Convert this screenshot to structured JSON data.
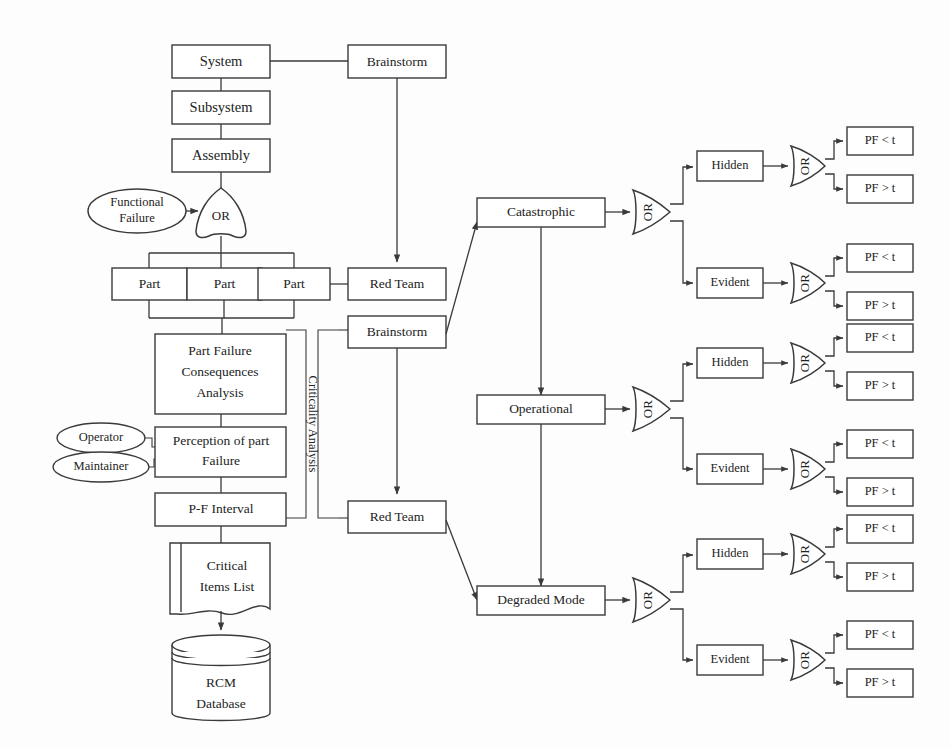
{
  "meta": {
    "background_color": "#fdfdfd",
    "line_color": "#3a3a3a",
    "text_color": "#232323"
  },
  "left_column": {
    "hierarchy": [
      {
        "id": "system",
        "label": "System"
      },
      {
        "id": "subsystem",
        "label": "Subsystem"
      },
      {
        "id": "assembly",
        "label": "Assembly"
      }
    ],
    "functional_failure_input": {
      "id": "functional-failure",
      "label_line1": "Functional",
      "label_line2": "Failure"
    },
    "or_gate": {
      "id": "or-gate-functional",
      "label": "OR"
    },
    "parts": [
      {
        "id": "part-1",
        "label": "Part"
      },
      {
        "id": "part-2",
        "label": "Part"
      },
      {
        "id": "part-3",
        "label": "Part"
      }
    ],
    "analysis_chain": [
      {
        "id": "pfca",
        "lines": [
          "Part Failure",
          "Consequences",
          "Analysis"
        ]
      },
      {
        "id": "perception",
        "lines": [
          "Perception of part",
          "Failure"
        ]
      },
      {
        "id": "pf-interval",
        "lines": [
          "P-F Interval"
        ]
      }
    ],
    "actors": [
      {
        "id": "operator",
        "label": "Operator"
      },
      {
        "id": "maintainer",
        "label": "Maintainer"
      }
    ],
    "critical_items_list": {
      "id": "critical-items-list",
      "lines": [
        "Critical",
        "Items List"
      ]
    },
    "database": {
      "id": "rcm-database",
      "lines": [
        "RCM",
        "Database"
      ]
    },
    "bracket_label": {
      "id": "criticality-analysis",
      "label": "Criticality Analysis"
    }
  },
  "middle_column": {
    "nodes": [
      {
        "id": "brainstorm-top",
        "label": "Brainstorm"
      },
      {
        "id": "red-team-top",
        "label": "Red Team"
      },
      {
        "id": "brainstorm-mid",
        "label": "Brainstorm"
      },
      {
        "id": "red-team-bottom",
        "label": "Red Team"
      }
    ]
  },
  "consequence_branches": [
    {
      "id": "catastrophic",
      "label": "Catastrophic",
      "gate": {
        "id": "or-gate-catastrophic",
        "label": "OR"
      },
      "children": [
        {
          "id": "catastrophic-hidden",
          "label": "Hidden",
          "gate": {
            "id": "or-gate-catastrophic-hidden",
            "label": "OR"
          },
          "outcomes": [
            {
              "id": "catastrophic-hidden-pf-lt",
              "label": "PF < t"
            },
            {
              "id": "catastrophic-hidden-pf-gt",
              "label": "PF > t"
            }
          ]
        },
        {
          "id": "catastrophic-evident",
          "label": "Evident",
          "gate": {
            "id": "or-gate-catastrophic-evident",
            "label": "OR"
          },
          "outcomes": [
            {
              "id": "catastrophic-evident-pf-lt",
              "label": "PF < t"
            },
            {
              "id": "catastrophic-evident-pf-gt",
              "label": "PF > t"
            }
          ]
        }
      ]
    },
    {
      "id": "operational",
      "label": "Operational",
      "gate": {
        "id": "or-gate-operational",
        "label": "OR"
      },
      "children": [
        {
          "id": "operational-hidden",
          "label": "Hidden",
          "gate": {
            "id": "or-gate-operational-hidden",
            "label": "OR"
          },
          "outcomes": [
            {
              "id": "operational-hidden-pf-lt",
              "label": "PF < t"
            },
            {
              "id": "operational-hidden-pf-gt",
              "label": "PF > t"
            }
          ]
        },
        {
          "id": "operational-evident",
          "label": "Evident",
          "gate": {
            "id": "or-gate-operational-evident",
            "label": "OR"
          },
          "outcomes": [
            {
              "id": "operational-evident-pf-lt",
              "label": "PF < t"
            },
            {
              "id": "operational-evident-pf-gt",
              "label": "PF > t"
            }
          ]
        }
      ]
    },
    {
      "id": "degraded-mode",
      "label": "Degraded Mode",
      "gate": {
        "id": "or-gate-degraded",
        "label": "OR"
      },
      "children": [
        {
          "id": "degraded-hidden",
          "label": "Hidden",
          "gate": {
            "id": "or-gate-degraded-hidden",
            "label": "OR"
          },
          "outcomes": [
            {
              "id": "degraded-hidden-pf-lt",
              "label": "PF < t"
            },
            {
              "id": "degraded-hidden-pf-gt",
              "label": "PF > t"
            }
          ]
        },
        {
          "id": "degraded-evident",
          "label": "Evident",
          "gate": {
            "id": "or-gate-degraded-evident",
            "label": "OR"
          },
          "outcomes": [
            {
              "id": "degraded-evident-pf-lt",
              "label": "PF < t"
            },
            {
              "id": "degraded-evident-pf-gt",
              "label": "PF > t"
            }
          ]
        }
      ]
    }
  ]
}
